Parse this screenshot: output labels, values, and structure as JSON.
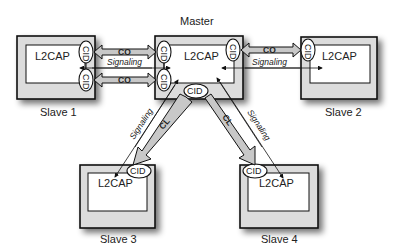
{
  "diagram": {
    "title": "Master",
    "colors": {
      "box_fill": "#dcdcdc",
      "inner_fill": "#ffffff",
      "arrow_fill": "#c8c8c8",
      "stroke": "#111111",
      "shadow": "#9a9a9a"
    },
    "nodes": {
      "master": {
        "label": "Master",
        "layer": "L2CAP"
      },
      "slave1": {
        "label": "Slave 1",
        "layer": "L2CAP"
      },
      "slave2": {
        "label": "Slave 2",
        "layer": "L2CAP"
      },
      "slave3": {
        "label": "Slave 3",
        "layer": "L2CAP"
      },
      "slave4": {
        "label": "Slave 4",
        "layer": "L2CAP"
      }
    },
    "cid_label": "CID",
    "edges": {
      "m_s1_co_top": {
        "label": "CO"
      },
      "m_s1_co_bottom": {
        "label": "CO"
      },
      "m_s1_signaling": {
        "label": "Signaling"
      },
      "m_s2_co": {
        "label": "CO"
      },
      "m_s2_signaling": {
        "label": "Signaling"
      },
      "m_s3_cl": {
        "label": "CL"
      },
      "m_s3_signaling": {
        "label": "Signaling"
      },
      "m_s4_cl": {
        "label": "CL"
      },
      "m_s4_signaling": {
        "label": "Signaling"
      }
    }
  }
}
